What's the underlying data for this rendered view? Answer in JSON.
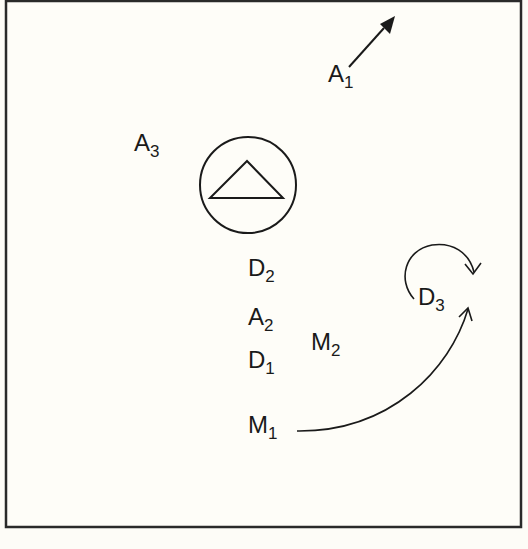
{
  "diagram": {
    "frame": {
      "stroke": "#2a2a2a"
    },
    "ink": "#1a1a1a",
    "labels": {
      "A1": {
        "letter": "A",
        "sub": "1"
      },
      "A2": {
        "letter": "A",
        "sub": "2"
      },
      "A3": {
        "letter": "A",
        "sub": "3"
      },
      "D1": {
        "letter": "D",
        "sub": "1"
      },
      "D2": {
        "letter": "D",
        "sub": "2"
      },
      "D3": {
        "letter": "D",
        "sub": "3"
      },
      "M1": {
        "letter": "M",
        "sub": "1"
      },
      "M2": {
        "letter": "M",
        "sub": "2"
      }
    },
    "symbols": [
      {
        "name": "circled-triangle",
        "description": "triangle inside a circle at center"
      },
      {
        "name": "pointer-arrow",
        "description": "short line with filled arrowhead pointing up-right from A1"
      },
      {
        "name": "curved-arrow",
        "description": "long arc from M1 to D3"
      },
      {
        "name": "rotation-arrow",
        "description": "clockwise curl arrow above D3"
      }
    ]
  }
}
